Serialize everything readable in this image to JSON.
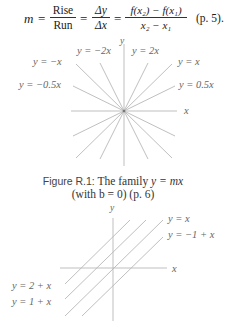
{
  "formula": {
    "lhs": "m",
    "eq": "=",
    "frac1": {
      "num": "Rise",
      "den": "Run"
    },
    "frac2": {
      "num": "Δy",
      "den": "Δx"
    },
    "frac3": {
      "num": "f(x₂) − f(x₁)",
      "den": "x₂ − x₁"
    },
    "ref": "(p. 5)."
  },
  "figure1": {
    "axis_x": "x",
    "axis_y": "y",
    "labels": {
      "neg2x": "y = −2x",
      "pos2x": "y = 2x",
      "negx": "y = −x",
      "posx": "y = x",
      "neg05x": "y = −0.5x",
      "pos05x": "y = 0.5x"
    },
    "caption_fig": "Figure R.1:",
    "caption_text": " The family ",
    "caption_math": "y = mx",
    "caption_line2": "(with b = 0) (p. 6)",
    "line_color": "#b8b8b8"
  },
  "figure2": {
    "axis_x": "x",
    "axis_y": "y",
    "labels": {
      "yx": "y = x",
      "ym1x": "y = −1 + x",
      "y2x": "y = 2 + x",
      "y1x": "y = 1 + x"
    },
    "line_color": "#b8b8b8"
  }
}
